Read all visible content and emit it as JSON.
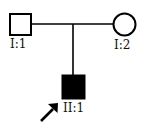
{
  "pedigree": {
    "generations": [
      "I",
      "II"
    ],
    "individuals": [
      {
        "id": "I:1",
        "label": "I:1",
        "sex": "male",
        "affected": false,
        "proband": false
      },
      {
        "id": "I:2",
        "label": "I:2",
        "sex": "female",
        "affected": false,
        "proband": false
      },
      {
        "id": "II:1",
        "label": "II:1",
        "sex": "male",
        "affected": true,
        "proband": true
      }
    ],
    "relationships": [
      {
        "type": "mating",
        "partners": [
          "I:1",
          "I:2"
        ]
      },
      {
        "type": "offspring",
        "parents": [
          "I:1",
          "I:2"
        ],
        "child": "II:1"
      }
    ],
    "proband_marker": "arrow-icon",
    "colors": {
      "line": "#000000",
      "affected_fill": "#000000",
      "unaffected_fill": "#ffffff"
    }
  }
}
